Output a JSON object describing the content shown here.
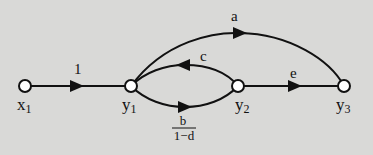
{
  "diagram": {
    "type": "signal-flow-graph",
    "background": "#d9d9d7",
    "stroke_color": "#111111",
    "nodes": [
      {
        "id": "x1",
        "label": "x",
        "sub": "1",
        "x": 25,
        "y": 86
      },
      {
        "id": "y1",
        "label": "y",
        "sub": "1",
        "x": 131,
        "y": 86
      },
      {
        "id": "y2",
        "label": "y",
        "sub": "2",
        "x": 238,
        "y": 86
      },
      {
        "id": "y3",
        "label": "y",
        "sub": "3",
        "x": 344,
        "y": 86
      }
    ],
    "edges": [
      {
        "from": "x1",
        "to": "y1",
        "gain": "1"
      },
      {
        "from": "y1",
        "to": "y3",
        "gain": "a"
      },
      {
        "from": "y2",
        "to": "y1",
        "gain": "c"
      },
      {
        "from": "y1",
        "to": "y2",
        "gain_num": "b",
        "gain_den": "1−d"
      },
      {
        "from": "y2",
        "to": "y3",
        "gain": "e"
      }
    ]
  }
}
